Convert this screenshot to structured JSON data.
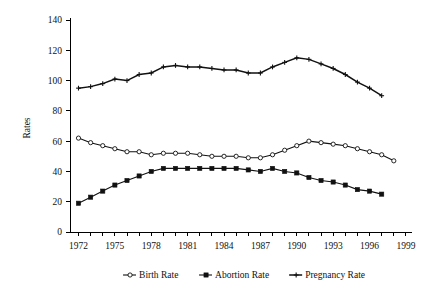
{
  "chart_data": {
    "type": "line",
    "title": "",
    "xlabel": "",
    "ylabel": "Rates",
    "xlim": [
      1971.3,
      1999.5
    ],
    "ylim": [
      0,
      140
    ],
    "ytick_values": [
      0,
      20,
      40,
      60,
      80,
      100,
      120,
      140
    ],
    "ytick_labels": [
      "0",
      "20",
      "40",
      "60",
      "80",
      "100",
      "120",
      "140"
    ],
    "xtick_values": [
      1972,
      1973,
      1974,
      1975,
      1976,
      1977,
      1978,
      1979,
      1980,
      1981,
      1982,
      1983,
      1984,
      1985,
      1986,
      1987,
      1988,
      1989,
      1990,
      1991,
      1992,
      1993,
      1994,
      1995,
      1996,
      1997,
      1998,
      1999
    ],
    "xtick_labels_shown": [
      "1972",
      "1975",
      "1978",
      "1981",
      "1984",
      "1987",
      "1990",
      "1993",
      "1996",
      "1999"
    ],
    "grid": false,
    "legend_position": "bottom",
    "x": [
      1972,
      1973,
      1974,
      1975,
      1976,
      1977,
      1978,
      1979,
      1980,
      1981,
      1982,
      1983,
      1984,
      1985,
      1986,
      1987,
      1988,
      1989,
      1990,
      1991,
      1992,
      1993,
      1994,
      1995,
      1996,
      1997,
      1998
    ],
    "series": [
      {
        "name": "Birth Rate",
        "marker": "open-circle",
        "color": "#111111",
        "values": [
          62,
          59,
          57,
          55,
          53,
          53,
          51,
          52,
          52,
          52,
          51,
          50,
          50,
          50,
          49,
          49,
          51,
          54,
          57,
          60,
          59,
          58,
          57,
          55,
          53,
          51,
          47
        ]
      },
      {
        "name": "Abortion Rate",
        "marker": "filled-square",
        "color": "#111111",
        "values": [
          19,
          23,
          27,
          31,
          34,
          37,
          40,
          42,
          42,
          42,
          42,
          42,
          42,
          42,
          41,
          40,
          42,
          40,
          39,
          36,
          34,
          33,
          31,
          28,
          27,
          25,
          null
        ]
      },
      {
        "name": "Pregnancy Rate",
        "marker": "cross",
        "color": "#111111",
        "values": [
          95,
          96,
          98,
          101,
          100,
          104,
          105,
          109,
          110,
          109,
          109,
          108,
          107,
          107,
          105,
          105,
          109,
          112,
          115,
          114,
          111,
          108,
          104,
          99,
          95,
          90,
          null
        ]
      }
    ]
  },
  "legend": {
    "items": [
      {
        "label": "Birth Rate",
        "marker": "open-circle"
      },
      {
        "label": "Abortion Rate",
        "marker": "filled-square"
      },
      {
        "label": "Pregnancy Rate",
        "marker": "cross"
      }
    ]
  },
  "axis": {
    "y_title": "Rates"
  }
}
